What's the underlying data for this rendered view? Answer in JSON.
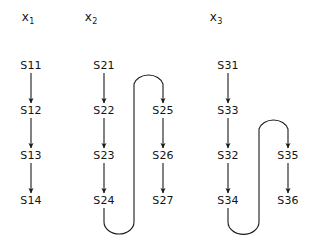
{
  "figure": {
    "background_color": "#ffffff",
    "stroke_color": "#1a1a1a",
    "text_color": "#141414",
    "width": 311,
    "height": 241
  },
  "columns": [
    {
      "id": "col-x1",
      "title_base": "x",
      "title_sub": "1",
      "title_x": 28,
      "title_y": 19
    },
    {
      "id": "col-x2",
      "title_base": "x",
      "title_sub": "2",
      "title_x": 91,
      "title_y": 19
    },
    {
      "id": "col-x3",
      "title_base": "x",
      "title_sub": "3",
      "title_x": 216,
      "title_y": 19
    }
  ],
  "nodes": [
    {
      "id": "S11",
      "label": "S11",
      "x": 31,
      "y": 66,
      "column": "x1"
    },
    {
      "id": "S12",
      "label": "S12",
      "x": 31,
      "y": 111,
      "column": "x1"
    },
    {
      "id": "S13",
      "label": "S13",
      "x": 31,
      "y": 156,
      "column": "x1"
    },
    {
      "id": "S14",
      "label": "S14",
      "x": 31,
      "y": 201,
      "column": "x1"
    },
    {
      "id": "S21",
      "label": "S21",
      "x": 104,
      "y": 66,
      "column": "x2"
    },
    {
      "id": "S22",
      "label": "S22",
      "x": 104,
      "y": 111,
      "column": "x2"
    },
    {
      "id": "S23",
      "label": "S23",
      "x": 104,
      "y": 156,
      "column": "x2"
    },
    {
      "id": "S24",
      "label": "S24",
      "x": 104,
      "y": 201,
      "column": "x2"
    },
    {
      "id": "S25",
      "label": "S25",
      "x": 163,
      "y": 111,
      "column": "x2"
    },
    {
      "id": "S26",
      "label": "S26",
      "x": 163,
      "y": 156,
      "column": "x2"
    },
    {
      "id": "S27",
      "label": "S27",
      "x": 163,
      "y": 201,
      "column": "x2"
    },
    {
      "id": "S31",
      "label": "S31",
      "x": 228,
      "y": 66,
      "column": "x3"
    },
    {
      "id": "S33",
      "label": "S33",
      "x": 228,
      "y": 111,
      "column": "x3"
    },
    {
      "id": "S32",
      "label": "S32",
      "x": 228,
      "y": 156,
      "column": "x3"
    },
    {
      "id": "S34",
      "label": "S34",
      "x": 228,
      "y": 201,
      "column": "x3"
    },
    {
      "id": "S35",
      "label": "S35",
      "x": 288,
      "y": 156,
      "column": "x3"
    },
    {
      "id": "S36",
      "label": "S36",
      "x": 288,
      "y": 201,
      "column": "x3"
    }
  ],
  "edges": [
    {
      "id": "e-S11-S12",
      "from": "S11",
      "to": "S12",
      "kind": "straight"
    },
    {
      "id": "e-S12-S13",
      "from": "S12",
      "to": "S13",
      "kind": "straight"
    },
    {
      "id": "e-S13-S14",
      "from": "S13",
      "to": "S14",
      "kind": "straight"
    },
    {
      "id": "e-S21-S22",
      "from": "S21",
      "to": "S22",
      "kind": "straight"
    },
    {
      "id": "e-S22-S23",
      "from": "S22",
      "to": "S23",
      "kind": "straight"
    },
    {
      "id": "e-S23-S24",
      "from": "S23",
      "to": "S24",
      "kind": "straight"
    },
    {
      "id": "e-S24-S25",
      "from": "S24",
      "to": "S25",
      "kind": "serpentine"
    },
    {
      "id": "e-S25-S26",
      "from": "S25",
      "to": "S26",
      "kind": "straight"
    },
    {
      "id": "e-S26-S27",
      "from": "S26",
      "to": "S27",
      "kind": "straight"
    },
    {
      "id": "e-S31-S33",
      "from": "S31",
      "to": "S33",
      "kind": "straight"
    },
    {
      "id": "e-S33-S32",
      "from": "S33",
      "to": "S32",
      "kind": "straight"
    },
    {
      "id": "e-S32-S34",
      "from": "S32",
      "to": "S34",
      "kind": "straight"
    },
    {
      "id": "e-S34-S35",
      "from": "S34",
      "to": "S35",
      "kind": "serpentine"
    },
    {
      "id": "e-S35-S36",
      "from": "S35",
      "to": "S36",
      "kind": "straight"
    }
  ]
}
